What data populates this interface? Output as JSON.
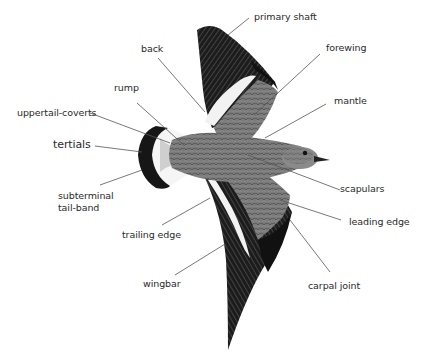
{
  "diagram": {
    "labels": {
      "primary_shaft": "primary shaft",
      "back": "back",
      "forewing": "forewing",
      "rump": "rump",
      "mantle": "mantle",
      "uppertail_coverts": "uppertail-coverts",
      "tertials": "tertials",
      "subterminal_line1": "subterminal",
      "subterminal_line2": "tail-band",
      "scapulars": "scapulars",
      "leading_edge": "leading edge",
      "trailing_edge": "trailing edge",
      "carpal_joint": "carpal joint",
      "wingbar": "wingbar"
    },
    "colors": {
      "background": "#ffffff",
      "text": "#2a2a2a",
      "leader": "#555555",
      "plumage_dark": "#1a1a1a",
      "plumage_mid": "#6e6e6e",
      "plumage_light": "#bdbdbd",
      "white_bar": "#f2f2f2"
    }
  }
}
